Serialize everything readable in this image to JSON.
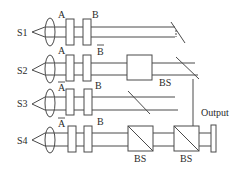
{
  "diagram": {
    "sources": [
      {
        "label": "S1",
        "first_element": "A",
        "first_bar": false,
        "second_element": "B",
        "second_bar": false
      },
      {
        "label": "S2",
        "first_element": "A",
        "first_bar": false,
        "second_element": "B",
        "second_bar": true
      },
      {
        "label": "S3",
        "first_element": "A",
        "first_bar": true,
        "second_element": "B",
        "second_bar": false
      },
      {
        "label": "S4",
        "first_element": "A",
        "first_bar": true,
        "second_element": "B",
        "second_bar": false
      }
    ],
    "labels": {
      "bs_upper": "BS",
      "bs_lower_left": "BS",
      "bs_lower_right": "BS",
      "output": "Output"
    },
    "colors": {
      "line": "#4a4a4a",
      "background": "#ffffff"
    }
  }
}
